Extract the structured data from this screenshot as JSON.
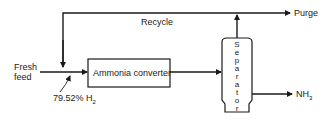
{
  "diagram": {
    "type": "process-flow",
    "nodes": {
      "converter": {
        "label": "Ammonia converter"
      },
      "separator": {
        "label": "Separator",
        "letters": [
          "S",
          "e",
          "p",
          "a",
          "r",
          "a",
          "t",
          "o",
          "r"
        ]
      }
    },
    "streams": {
      "fresh_feed": {
        "label_line1": "Fresh",
        "label_line2": "feed"
      },
      "recycle": {
        "label": "Recycle"
      },
      "purge": {
        "label": "Purge"
      },
      "product": {
        "label_main": "NH",
        "label_sub": "3"
      },
      "mix_point": {
        "label_main": "79.52% H",
        "label_sub": "2"
      }
    },
    "colors": {
      "line": "#1a1a1a",
      "background": "#ffffff"
    }
  }
}
